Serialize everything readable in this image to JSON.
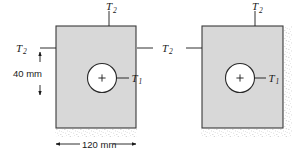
{
  "figure": {
    "blocks": [
      {
        "id": "left-block",
        "hole_label": "T",
        "hole_label_sub": "1",
        "surface_label_top": "T",
        "surface_label_top_sub": "2",
        "surface_label_side": "T",
        "surface_label_side_sub": "2",
        "insulated_edges": "bottom"
      },
      {
        "id": "right-block",
        "hole_label": "T",
        "hole_label_sub": "1",
        "surface_label_top": "T",
        "surface_label_top_sub": "2",
        "surface_label_side": "T",
        "surface_label_side_sub": "2",
        "insulated_edges": "bottom, right"
      }
    ],
    "dimensions": [
      {
        "id": "vertical-dim",
        "value": "40 mm",
        "orientation": "vertical"
      },
      {
        "id": "horizontal-dim",
        "value": "120 mm",
        "orientation": "horizontal"
      }
    ],
    "colors": {
      "block_fill": "#d8d8d8",
      "block_stroke": "#3a3a3a",
      "line": "#1a1a1a",
      "hole_fill": "#ffffff",
      "stipple": "#9a9a9a",
      "background": "#ffffff"
    }
  }
}
